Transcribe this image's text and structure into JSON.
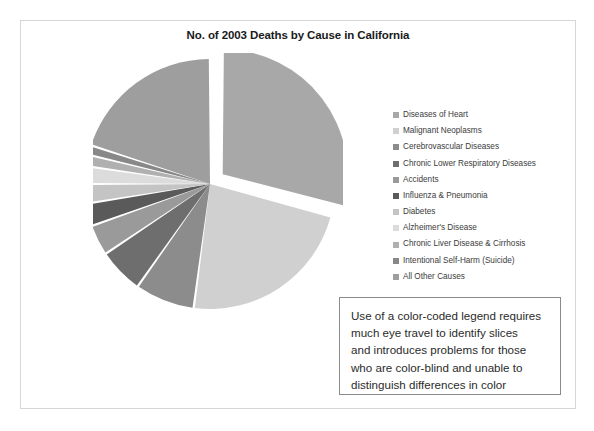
{
  "slide": {
    "title": "No. of 2003 Deaths by Cause in California"
  },
  "chart_data": {
    "type": "pie",
    "title": "No. of 2003 Deaths by Cause in California",
    "xlabel": "",
    "ylabel": "",
    "legend_position": "right",
    "grid": false,
    "exploded_slice": "Diseases of Heart",
    "units": "deaths",
    "categories": [
      "Diseases of Heart",
      "Malignant Neoplasms",
      "Cerebrovascular Diseases",
      "Chronic Lower Respiratory Diseases",
      "Accidents",
      "Influenza & Pneumonia",
      "Diabetes",
      "Alzheimer's Disease",
      "Chronic Liver Disease & Cirrhosis",
      "Intentional Self-Harm (Suicide)",
      "All Other Causes"
    ],
    "values": [
      70000,
      55000,
      18500,
      14000,
      9500,
      7000,
      6000,
      5500,
      3500,
      3000,
      48000
    ],
    "percentages": [
      28.6,
      22.5,
      7.6,
      5.7,
      3.9,
      2.9,
      2.5,
      2.2,
      1.4,
      1.2,
      19.6
    ],
    "colors": [
      "#a8a8a8",
      "#d0d0d0",
      "#8c8c8c",
      "#6e6e6e",
      "#9a9a9a",
      "#5a5a5a",
      "#c4c4c4",
      "#dcdcdc",
      "#b0b0b0",
      "#888888",
      "#9e9e9e"
    ]
  },
  "legend": {
    "items": [
      {
        "label": "Diseases of Heart",
        "color": "#a8a8a8"
      },
      {
        "label": "Malignant Neoplasms",
        "color": "#d0d0d0"
      },
      {
        "label": "Cerebrovascular Diseases",
        "color": "#8c8c8c"
      },
      {
        "label": "Chronic Lower Respiratory Diseases",
        "color": "#6e6e6e"
      },
      {
        "label": "Accidents",
        "color": "#9a9a9a"
      },
      {
        "label": "Influenza & Pneumonia",
        "color": "#5a5a5a"
      },
      {
        "label": "Diabetes",
        "color": "#c4c4c4"
      },
      {
        "label": "Alzheimer's Disease",
        "color": "#dcdcdc"
      },
      {
        "label": "Chronic Liver Disease & Cirrhosis",
        "color": "#b0b0b0"
      },
      {
        "label": "Intentional Self-Harm (Suicide)",
        "color": "#888888"
      },
      {
        "label": "All Other Causes",
        "color": "#9e9e9e"
      }
    ]
  },
  "annotation": {
    "lines": [
      "Use of a color-coded legend requires",
      "much eye travel to identify slices",
      "and introduces problems for those",
      "who are color-blind and unable to",
      "distinguish differences in color"
    ]
  }
}
